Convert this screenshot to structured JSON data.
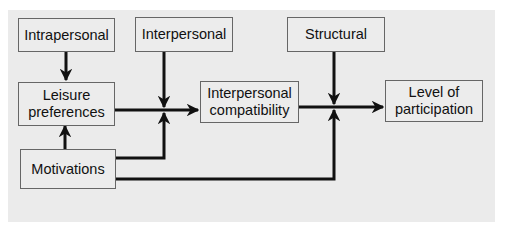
{
  "diagram": {
    "nodes": {
      "intrapersonal": {
        "label": "Intrapersonal"
      },
      "interpersonal": {
        "label": "Interpersonal"
      },
      "structural": {
        "label": "Structural"
      },
      "leisure_preferences": {
        "line1": "Leisure",
        "line2": "preferences"
      },
      "interpersonal_compatibility": {
        "line1": "Interpersonal",
        "line2": "compatibility"
      },
      "level_of_participation": {
        "line1": "Level of",
        "line2": "participation"
      },
      "motivations": {
        "label": "Motivations"
      }
    },
    "edges": [
      {
        "from": "Intrapersonal",
        "to": "Leisure preferences"
      },
      {
        "from": "Motivations",
        "to": "Leisure preferences"
      },
      {
        "from": "Leisure preferences",
        "to": "Interpersonal compatibility"
      },
      {
        "from": "Interpersonal",
        "to": "Leisure preferences → Interpersonal compatibility junction"
      },
      {
        "from": "Motivations",
        "to": "Leisure preferences → Interpersonal compatibility junction"
      },
      {
        "from": "Interpersonal compatibility",
        "to": "Level of participation"
      },
      {
        "from": "Structural",
        "to": "Interpersonal compatibility → Level of participation junction"
      },
      {
        "from": "Motivations",
        "to": "Interpersonal compatibility → Level of participation junction"
      }
    ],
    "colors": {
      "panel": "#ebebeb",
      "box_border": "#666666",
      "arrow": "#111111",
      "text": "#111111"
    }
  }
}
